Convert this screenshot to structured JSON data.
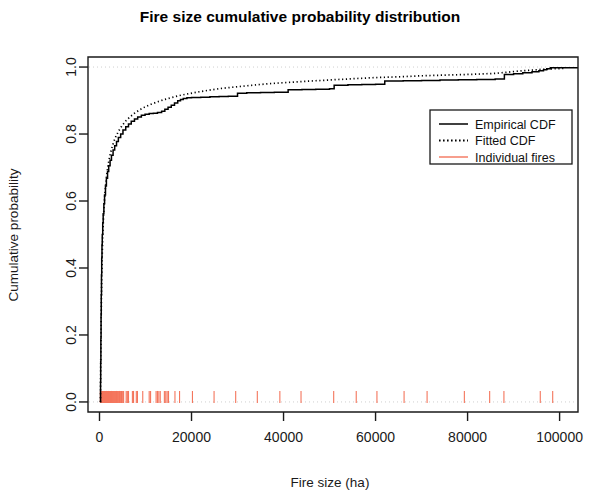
{
  "chart_data": {
    "type": "line",
    "title": "Fire size cumulative probability distribution",
    "xlabel": "Fire size (ha)",
    "ylabel": "Cumulative probability",
    "xlim": [
      -2500,
      104000
    ],
    "ylim": [
      -0.03,
      1.03
    ],
    "grid": true,
    "legend_position": "right",
    "xticks": [
      0,
      20000,
      40000,
      60000,
      80000,
      100000
    ],
    "xtick_labels": [
      "0",
      "20000",
      "40000",
      "60000",
      "80000",
      "100000"
    ],
    "yticks": [
      0.0,
      0.2,
      0.4,
      0.6,
      0.8,
      1.0
    ],
    "ytick_labels": [
      "0.0",
      "0.2",
      "0.4",
      "0.6",
      "0.8",
      "1.0"
    ],
    "gridlines_y": [
      0.0,
      1.0
    ],
    "series": [
      {
        "name": "Empirical CDF",
        "style": "solid",
        "color": "#000000",
        "points": [
          [
            200,
            0.0
          ],
          [
            230,
            0.06
          ],
          [
            260,
            0.12
          ],
          [
            300,
            0.19
          ],
          [
            340,
            0.26
          ],
          [
            380,
            0.32
          ],
          [
            430,
            0.38
          ],
          [
            480,
            0.43
          ],
          [
            540,
            0.47
          ],
          [
            600,
            0.5
          ],
          [
            700,
            0.535
          ],
          [
            800,
            0.562
          ],
          [
            950,
            0.592
          ],
          [
            1100,
            0.618
          ],
          [
            1300,
            0.645
          ],
          [
            1500,
            0.668
          ],
          [
            1750,
            0.688
          ],
          [
            2000,
            0.705
          ],
          [
            2300,
            0.722
          ],
          [
            2600,
            0.737
          ],
          [
            2950,
            0.752
          ],
          [
            3300,
            0.765
          ],
          [
            3700,
            0.778
          ],
          [
            4100,
            0.79
          ],
          [
            4600,
            0.8
          ],
          [
            5100,
            0.812
          ],
          [
            5700,
            0.822
          ],
          [
            6300,
            0.83
          ],
          [
            6900,
            0.838
          ],
          [
            7600,
            0.845
          ],
          [
            8300,
            0.851
          ],
          [
            9100,
            0.856
          ],
          [
            9900,
            0.859
          ],
          [
            10800,
            0.861
          ],
          [
            11700,
            0.862
          ],
          [
            12600,
            0.864
          ],
          [
            13500,
            0.868
          ],
          [
            14200,
            0.874
          ],
          [
            14900,
            0.88
          ],
          [
            15600,
            0.886
          ],
          [
            16300,
            0.893
          ],
          [
            17000,
            0.899
          ],
          [
            17600,
            0.903
          ],
          [
            18200,
            0.906
          ],
          [
            19000,
            0.908
          ],
          [
            20000,
            0.909
          ],
          [
            22000,
            0.91
          ],
          [
            24000,
            0.911
          ],
          [
            26000,
            0.912
          ],
          [
            28000,
            0.913
          ],
          [
            30000,
            0.922
          ],
          [
            32000,
            0.923
          ],
          [
            35000,
            0.924
          ],
          [
            38000,
            0.925
          ],
          [
            41000,
            0.932
          ],
          [
            44000,
            0.933
          ],
          [
            47000,
            0.934
          ],
          [
            50000,
            0.935
          ],
          [
            51000,
            0.946
          ],
          [
            54000,
            0.947
          ],
          [
            57000,
            0.948
          ],
          [
            60000,
            0.949
          ],
          [
            62000,
            0.958
          ],
          [
            66000,
            0.959
          ],
          [
            70000,
            0.96
          ],
          [
            74000,
            0.961
          ],
          [
            78000,
            0.962
          ],
          [
            82000,
            0.963
          ],
          [
            86000,
            0.964
          ],
          [
            88000,
            0.978
          ],
          [
            90000,
            0.98
          ],
          [
            92000,
            0.983
          ],
          [
            94000,
            0.986
          ],
          [
            95500,
            0.989
          ],
          [
            96500,
            0.992
          ],
          [
            97200,
            0.995
          ],
          [
            98000,
            0.998
          ],
          [
            100000,
            0.998
          ]
        ]
      },
      {
        "name": "Fitted CDF",
        "style": "dotted",
        "color": "#000000",
        "points": [
          [
            200,
            0.0
          ],
          [
            260,
            0.1
          ],
          [
            320,
            0.19
          ],
          [
            380,
            0.27
          ],
          [
            450,
            0.34
          ],
          [
            530,
            0.4
          ],
          [
            620,
            0.455
          ],
          [
            720,
            0.5
          ],
          [
            840,
            0.543
          ],
          [
            980,
            0.582
          ],
          [
            1150,
            0.618
          ],
          [
            1350,
            0.65
          ],
          [
            1600,
            0.681
          ],
          [
            1900,
            0.71
          ],
          [
            2250,
            0.735
          ],
          [
            2650,
            0.757
          ],
          [
            3100,
            0.777
          ],
          [
            3600,
            0.794
          ],
          [
            4200,
            0.81
          ],
          [
            4900,
            0.825
          ],
          [
            5700,
            0.839
          ],
          [
            6600,
            0.851
          ],
          [
            7600,
            0.862
          ],
          [
            8700,
            0.872
          ],
          [
            9900,
            0.881
          ],
          [
            11200,
            0.889
          ],
          [
            12600,
            0.896
          ],
          [
            14100,
            0.903
          ],
          [
            15700,
            0.909
          ],
          [
            17400,
            0.915
          ],
          [
            19200,
            0.92
          ],
          [
            21200,
            0.925
          ],
          [
            23400,
            0.93
          ],
          [
            25800,
            0.935
          ],
          [
            28400,
            0.939
          ],
          [
            31200,
            0.943
          ],
          [
            34200,
            0.947
          ],
          [
            37400,
            0.951
          ],
          [
            40800,
            0.954
          ],
          [
            44400,
            0.957
          ],
          [
            48200,
            0.96
          ],
          [
            52200,
            0.963
          ],
          [
            56400,
            0.966
          ],
          [
            60800,
            0.969
          ],
          [
            65400,
            0.971
          ],
          [
            70200,
            0.974
          ],
          [
            75200,
            0.976
          ],
          [
            80400,
            0.978
          ],
          [
            85800,
            0.981
          ],
          [
            89000,
            0.985
          ],
          [
            91000,
            0.988
          ],
          [
            93000,
            0.99
          ],
          [
            95000,
            0.992
          ],
          [
            97000,
            0.994
          ],
          [
            99000,
            0.995
          ],
          [
            101000,
            0.996
          ]
        ]
      }
    ],
    "rug": {
      "name": "Individual fires",
      "color": "#f4755c",
      "values": [
        180,
        260,
        330,
        400,
        470,
        540,
        610,
        690,
        760,
        830,
        900,
        980,
        1050,
        1130,
        1200,
        1280,
        1360,
        1440,
        1520,
        1600,
        1690,
        1780,
        1860,
        1950,
        2040,
        2130,
        2220,
        2320,
        2410,
        2500,
        2600,
        2700,
        2800,
        2900,
        3000,
        3110,
        3220,
        3330,
        3450,
        3570,
        3690,
        3810,
        3940,
        4070,
        4200,
        4340,
        4480,
        4620,
        4770,
        4920,
        5080,
        5240,
        5800,
        6050,
        6300,
        7150,
        7400,
        8000,
        8250,
        9400,
        10800,
        11100,
        12300,
        12600,
        12900,
        13200,
        14100,
        14400,
        14700,
        15000,
        16400,
        17400,
        20200,
        24900,
        29600,
        34300,
        39200,
        43800,
        50900,
        55800,
        60300,
        66200,
        71200,
        79300,
        84800,
        87900,
        95800,
        98500
      ]
    }
  },
  "legend": {
    "items": [
      {
        "label": "Empirical CDF",
        "style": "solid",
        "color": "#000000"
      },
      {
        "label": "Fitted CDF",
        "style": "dotted",
        "color": "#000000"
      },
      {
        "label": "Individual fires",
        "style": "solid",
        "color": "#f4755c"
      }
    ]
  }
}
